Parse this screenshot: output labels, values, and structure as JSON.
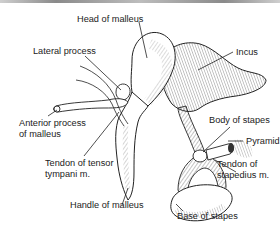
{
  "figure": {
    "labels": {
      "head_of_malleus": "Head of malleus",
      "lateral_process": "Lateral process",
      "incus": "Incus",
      "anterior_process_line1": "Anterior process",
      "anterior_process_line2": "of malleus",
      "body_of_stapes": "Body of stapes",
      "pyramid": "Pyramid",
      "tendon_tensor_line1": "Tendon of tensor",
      "tendon_tensor_line2": "tympani m.",
      "tendon_stapedius_line1": "Tendon of",
      "tendon_stapedius_line2": "stapedius m.",
      "handle_of_malleus": "Handle of malleus",
      "base_of_stapes": "Base of stapes"
    },
    "colors": {
      "ink": "#222222",
      "background": "#ffffff"
    }
  }
}
